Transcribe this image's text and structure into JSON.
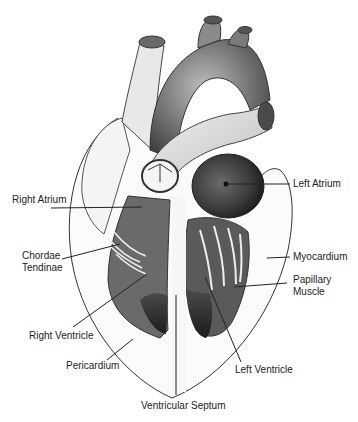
{
  "diagram": {
    "labels": {
      "right_atrium": "Right Atrium",
      "chordae_tendinae_line1": "Chordae",
      "chordae_tendinae_line2": "Tendinae",
      "right_ventricle": "Right Ventricle",
      "pericardium": "Pericardium",
      "ventricular_septum": "Ventricular Septum",
      "left_ventricle": "Left Ventricle",
      "papillary_muscle_line1": "Papillary",
      "papillary_muscle_line2": "Muscle",
      "myocardium": "Myocardium",
      "left_atrium": "Left Atrium"
    },
    "colors": {
      "background": "#ffffff",
      "ink": "#222222",
      "shade_dark": "#2a2a2a",
      "shade_mid": "#8a8a8a",
      "shade_light": "#d8d8d8"
    }
  }
}
